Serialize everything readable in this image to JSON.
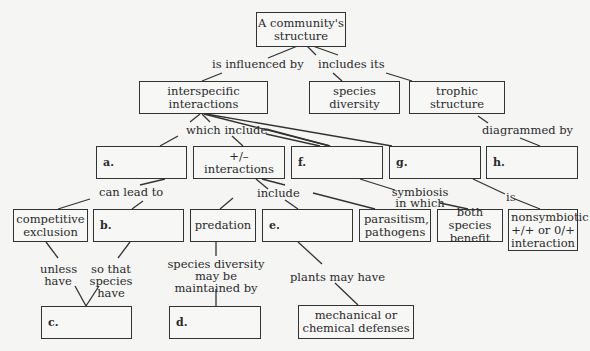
{
  "diagram": {
    "type": "concept-map",
    "nodes": {
      "root": "A community's structure",
      "interspecific": "interspecific interactions",
      "species_diversity": "species diversity",
      "trophic_structure": "trophic structure",
      "a": "a.",
      "plus_minus": "+/– interactions",
      "f": "f.",
      "g": "g.",
      "h": "h.",
      "competitive_exclusion": "competitive exclusion",
      "b": "b.",
      "predation": "predation",
      "e": "e.",
      "parasitism": "parasitism, pathogens",
      "both_benefit": "both species benefit",
      "nonsymbiotic": "nonsymbiotic +/+ or 0/+ interaction",
      "c": "c.",
      "d": "d.",
      "mech_chem": "mechanical or chemical defenses"
    },
    "links": {
      "is_influenced_by": "is influenced by",
      "includes_its": "includes its",
      "which_include": "which include",
      "diagrammed_by": "diagrammed by",
      "can_lead_to": "can lead to",
      "include": "include",
      "symbiosis_in_which": "symbiosis in which",
      "is": "is",
      "unless_have": "unless have",
      "so_that_species_have": "so that species have",
      "species_diversity_maintained": "species diversity may be maintained by",
      "plants_may_have": "plants may have"
    }
  }
}
